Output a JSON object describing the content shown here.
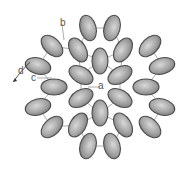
{
  "diagram": {
    "colors": {
      "bead_fill": "#9a9a9a",
      "bead_highlight": "#d8d8d8",
      "bead_outline": "#4a4a4a",
      "thread": "#8a8a8a",
      "label": "#555555"
    },
    "labels": [
      {
        "id": "a",
        "text": "a",
        "x": 100,
        "y": 82
      },
      {
        "id": "b",
        "text": "b",
        "x": 60,
        "y": 20
      },
      {
        "id": "c",
        "text": "c",
        "x": 32,
        "y": 73
      },
      {
        "id": "d",
        "text": "d",
        "x": 18,
        "y": 67
      }
    ],
    "beads": [
      {
        "ring": "inner",
        "x": 100,
        "y": 61,
        "angle": 90
      },
      {
        "ring": "inner",
        "x": 100,
        "y": 113,
        "angle": 90
      },
      {
        "ring": "inner",
        "x": 81,
        "y": 75,
        "angle": 30
      },
      {
        "ring": "inner",
        "x": 120,
        "y": 75,
        "angle": -30
      },
      {
        "ring": "inner",
        "x": 81,
        "y": 98,
        "angle": -30
      },
      {
        "ring": "inner",
        "x": 120,
        "y": 98,
        "angle": 30
      },
      {
        "ring": "middle",
        "x": 78,
        "y": 50,
        "angle": 60
      },
      {
        "ring": "middle",
        "x": 123,
        "y": 50,
        "angle": -60
      },
      {
        "ring": "middle",
        "x": 54,
        "y": 87,
        "angle": 0
      },
      {
        "ring": "middle",
        "x": 146,
        "y": 87,
        "angle": 0
      },
      {
        "ring": "middle",
        "x": 78,
        "y": 125,
        "angle": -60
      },
      {
        "ring": "middle",
        "x": 123,
        "y": 125,
        "angle": 60
      },
      {
        "ring": "outer",
        "x": 88,
        "y": 28,
        "angle": 75
      },
      {
        "ring": "outer",
        "x": 112,
        "y": 28,
        "angle": 105
      },
      {
        "ring": "outer",
        "x": 52,
        "y": 46,
        "angle": 45
      },
      {
        "ring": "outer",
        "x": 38,
        "y": 66,
        "angle": 15
      },
      {
        "ring": "outer",
        "x": 150,
        "y": 46,
        "angle": -45
      },
      {
        "ring": "outer",
        "x": 162,
        "y": 66,
        "angle": -15
      },
      {
        "ring": "outer",
        "x": 38,
        "y": 107,
        "angle": -15
      },
      {
        "ring": "outer",
        "x": 52,
        "y": 127,
        "angle": -45
      },
      {
        "ring": "outer",
        "x": 162,
        "y": 107,
        "angle": 15
      },
      {
        "ring": "outer",
        "x": 150,
        "y": 127,
        "angle": 45
      },
      {
        "ring": "outer",
        "x": 88,
        "y": 146,
        "angle": 105
      },
      {
        "ring": "outer",
        "x": 112,
        "y": 146,
        "angle": 75
      }
    ]
  }
}
